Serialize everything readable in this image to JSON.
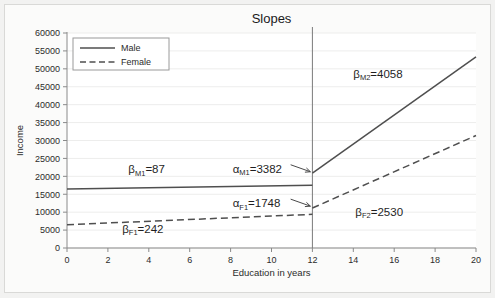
{
  "chart_data": {
    "type": "line",
    "title": "Slopes",
    "xlabel": "Education in years",
    "ylabel": "Income",
    "xlim": [
      0,
      20
    ],
    "ylim": [
      0,
      60000
    ],
    "xticks": [
      0,
      2,
      4,
      6,
      8,
      10,
      12,
      14,
      16,
      18,
      20
    ],
    "xtick_labels": [
      "0",
      "2",
      "4",
      "6",
      "8",
      "10",
      "12",
      "14",
      "16",
      "18",
      "20"
    ],
    "yticks": [
      0,
      5000,
      10000,
      15000,
      20000,
      25000,
      30000,
      35000,
      40000,
      45000,
      50000,
      55000,
      60000
    ],
    "ytick_labels": [
      "0",
      "5000",
      "10000",
      "15000",
      "20000",
      "25000",
      "30000",
      "35000",
      "40000",
      "45000",
      "50000",
      "55000",
      "60000"
    ],
    "grid": "horizontal-faint",
    "legend_position": "top-left",
    "knot_x": 12,
    "series": [
      {
        "name": "Male",
        "style": "solid",
        "segments": [
          {
            "x": [
              0,
              12
            ],
            "y": [
              16456,
              17500
            ]
          },
          {
            "x": [
              12,
              20
            ],
            "y": [
              20882,
              53346
            ]
          }
        ]
      },
      {
        "name": "Female",
        "style": "dashed",
        "segments": [
          {
            "x": [
              0,
              12
            ],
            "y": [
              6496,
              9400
            ]
          },
          {
            "x": [
              12,
              20
            ],
            "y": [
              11148,
              31388
            ]
          }
        ]
      }
    ],
    "annotations": [
      {
        "id": "beta-m1",
        "symbol": "β",
        "sub": "M1",
        "value": "87",
        "text": "βM1=87",
        "x": 3.0,
        "y": 20900
      },
      {
        "id": "beta-f1",
        "symbol": "β",
        "sub": "F1",
        "value": "242",
        "text": "βF1=242",
        "x": 2.7,
        "y": 4200
      },
      {
        "id": "alpha-m1",
        "symbol": "α",
        "sub": "M1",
        "value": "3382",
        "text": "αM1=3382",
        "x": 8.1,
        "y": 21000,
        "arrow": true
      },
      {
        "id": "alpha-f1",
        "symbol": "α",
        "sub": "F1",
        "value": "1748",
        "text": "αF1=1748",
        "x": 8.1,
        "y": 11400,
        "arrow": true
      },
      {
        "id": "beta-m2",
        "symbol": "β",
        "sub": "M2",
        "value": "4058",
        "text": "βM2=4058",
        "x": 14.0,
        "y": 47500
      },
      {
        "id": "beta-f2",
        "symbol": "β",
        "sub": "F2",
        "value": "2530",
        "text": "βF2=2530",
        "x": 14.1,
        "y": 9000
      }
    ],
    "colors": {
      "male_line": "#4f4f4f",
      "female_line": "#4f4f4f",
      "axis": "#8a8a8a",
      "grid": "#ededec",
      "plot_background": "#ffffff",
      "figure_background": "#f2f2f1",
      "text": "#1f1f1f"
    }
  },
  "legend": {
    "items": [
      {
        "label": "Male",
        "style": "solid"
      },
      {
        "label": "Female",
        "style": "dashed"
      }
    ]
  }
}
